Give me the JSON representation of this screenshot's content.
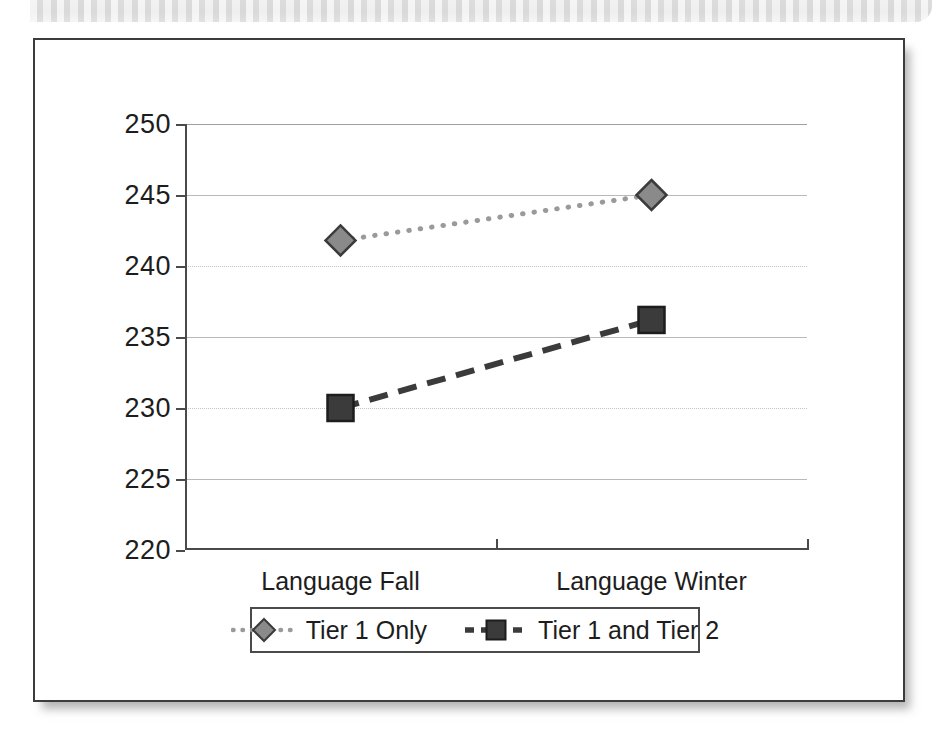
{
  "figure": {
    "frame_border_color": "#3c3c3c",
    "background": "#ffffff"
  },
  "chart_data": {
    "type": "line",
    "title": "",
    "xlabel": "",
    "ylabel": "",
    "categories": [
      "Language Fall",
      "Language Winter"
    ],
    "ylim": [
      220,
      250
    ],
    "yticks": [
      220,
      225,
      230,
      235,
      240,
      245,
      250
    ],
    "ytick_labels": [
      "220",
      "225",
      "230",
      "235",
      "240",
      "245",
      "250"
    ],
    "grid": true,
    "legend_position": "bottom",
    "series": [
      {
        "name": "Tier 1 Only",
        "values": [
          241.8,
          245.0
        ],
        "marker": "diamond",
        "marker_color": "#8a8a8a",
        "marker_edge_color": "#3b3b3b",
        "line_style": "dotted",
        "line_color": "#9a9a9a"
      },
      {
        "name": "Tier 1 and Tier 2",
        "values": [
          230.0,
          236.2
        ],
        "marker": "square",
        "marker_color": "#3b3b3b",
        "marker_edge_color": "#1d1d1d",
        "line_style": "dashed",
        "line_color": "#3b3b3b"
      }
    ]
  },
  "legend": {
    "entries": [
      {
        "label": "Tier 1 Only",
        "key_icon": "dotted-line-diamond-marker-icon"
      },
      {
        "label": "Tier 1 and Tier 2",
        "key_icon": "dashed-line-square-marker-icon"
      }
    ]
  }
}
